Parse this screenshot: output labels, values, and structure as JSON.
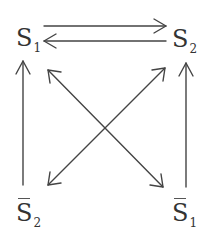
{
  "diagram": {
    "type": "state-transition",
    "colors": {
      "stroke": "#444444",
      "text": "#333333",
      "background": "#ffffff"
    },
    "nodes": [
      {
        "id": "S1",
        "symbol": "S",
        "subscript": "1",
        "overline": false,
        "position": "top-left"
      },
      {
        "id": "S2",
        "symbol": "S",
        "subscript": "2",
        "overline": false,
        "position": "top-right"
      },
      {
        "id": "notS2",
        "symbol": "S",
        "subscript": "2",
        "overline": true,
        "position": "bottom-left"
      },
      {
        "id": "notS1",
        "symbol": "S",
        "subscript": "1",
        "overline": true,
        "position": "bottom-right"
      }
    ],
    "edges": [
      {
        "from": "S1",
        "to": "S2",
        "direction": "one-way",
        "style": "upper horizontal"
      },
      {
        "from": "S2",
        "to": "S1",
        "direction": "one-way",
        "style": "lower horizontal"
      },
      {
        "from": "notS2",
        "to": "S1",
        "direction": "one-way",
        "style": "vertical"
      },
      {
        "from": "notS1",
        "to": "S2",
        "direction": "one-way",
        "style": "vertical"
      },
      {
        "from": "S1",
        "to": "notS1",
        "direction": "two-way",
        "style": "diagonal"
      },
      {
        "from": "S2",
        "to": "notS2",
        "direction": "two-way",
        "style": "diagonal"
      }
    ]
  }
}
